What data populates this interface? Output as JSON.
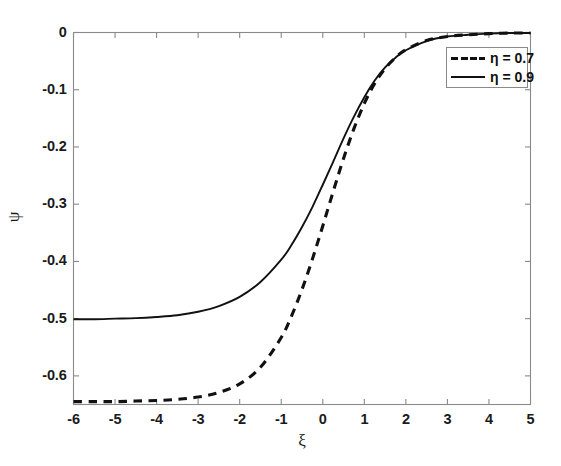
{
  "figure": {
    "background_color": "#ffffff",
    "line_color": "#111111",
    "axis_color": "#8a8a8a"
  },
  "axes": {
    "xlabel": "ξ",
    "ylabel": "ψ",
    "x_ticks": [
      "-6",
      "-5",
      "-4",
      "-3",
      "-2",
      "-1",
      "0",
      "1",
      "2",
      "3",
      "4",
      "5"
    ],
    "y_ticks": [
      "0",
      "-0.1",
      "-0.2",
      "-0.3",
      "-0.4",
      "-0.5",
      "-0.6"
    ]
  },
  "legend": {
    "position": "upper-right",
    "entries": [
      {
        "label": "η = 0.7",
        "style": "dashed"
      },
      {
        "label": "η = 0.9",
        "style": "solid"
      }
    ]
  },
  "chart_data": {
    "type": "line",
    "title": "",
    "xlabel": "ξ",
    "ylabel": "ψ",
    "xlim": [
      -6,
      5
    ],
    "ylim": [
      -0.65,
      0
    ],
    "xticks": [
      -6,
      -5,
      -4,
      -3,
      -2,
      -1,
      0,
      1,
      2,
      3,
      4,
      5
    ],
    "yticks": [
      0,
      -0.1,
      -0.2,
      -0.3,
      -0.4,
      -0.5,
      -0.6
    ],
    "grid": false,
    "legend_position": "upper right",
    "series": [
      {
        "name": "η = 0.7",
        "style": "dashed",
        "color": "#111111",
        "x": [
          -6,
          -5.5,
          -5,
          -4.5,
          -4,
          -3.5,
          -3,
          -2.5,
          -2,
          -1.5,
          -1,
          -0.75,
          -0.5,
          -0.25,
          0,
          0.25,
          0.5,
          0.75,
          1,
          1.25,
          1.5,
          1.75,
          2,
          2.5,
          3,
          3.5,
          4,
          4.5,
          5
        ],
        "y": [
          -0.645,
          -0.645,
          -0.645,
          -0.644,
          -0.643,
          -0.641,
          -0.637,
          -0.629,
          -0.614,
          -0.585,
          -0.533,
          -0.495,
          -0.449,
          -0.396,
          -0.338,
          -0.278,
          -0.22,
          -0.168,
          -0.124,
          -0.089,
          -0.063,
          -0.044,
          -0.03,
          -0.014,
          -0.007,
          -0.004,
          -0.002,
          -0.001,
          -0.001
        ]
      },
      {
        "name": "η = 0.9",
        "style": "solid",
        "color": "#111111",
        "x": [
          -6,
          -5.5,
          -5,
          -4.5,
          -4,
          -3.5,
          -3,
          -2.5,
          -2,
          -1.5,
          -1,
          -0.75,
          -0.5,
          -0.25,
          0,
          0.25,
          0.5,
          0.75,
          1,
          1.25,
          1.5,
          1.75,
          2,
          2.5,
          3,
          3.5,
          4,
          4.5,
          5
        ],
        "y": [
          -0.501,
          -0.501,
          -0.5,
          -0.499,
          -0.497,
          -0.494,
          -0.488,
          -0.478,
          -0.462,
          -0.436,
          -0.397,
          -0.371,
          -0.34,
          -0.305,
          -0.266,
          -0.226,
          -0.185,
          -0.147,
          -0.113,
          -0.084,
          -0.061,
          -0.044,
          -0.031,
          -0.015,
          -0.007,
          -0.004,
          -0.002,
          -0.001,
          -0.001
        ]
      }
    ]
  }
}
